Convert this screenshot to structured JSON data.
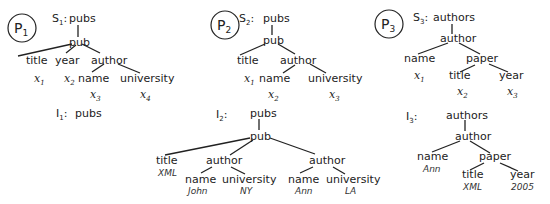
{
  "patterns": [
    {
      "id": "P",
      "sub": "1"
    },
    {
      "id": "P",
      "sub": "2"
    },
    {
      "id": "P",
      "sub": "3"
    }
  ],
  "schemas": [
    {
      "label": "S",
      "sub": "1",
      "nodes": [
        {
          "name": "pubs"
        },
        {
          "name": "pub"
        },
        {
          "name": "title",
          "var": "x",
          "vsub": "1"
        },
        {
          "name": "year",
          "var": "x",
          "vsub": "2"
        },
        {
          "name": "author"
        },
        {
          "name": "name",
          "var": "x",
          "vsub": "3"
        },
        {
          "name": "university",
          "var": "x",
          "vsub": "4"
        }
      ]
    },
    {
      "label": "S",
      "sub": "2",
      "nodes": [
        {
          "name": "pubs"
        },
        {
          "name": "pub"
        },
        {
          "name": "title",
          "var": "x",
          "vsub": "1"
        },
        {
          "name": "author"
        },
        {
          "name": "name",
          "var": "x",
          "vsub": "2"
        },
        {
          "name": "university",
          "var": "x",
          "vsub": "3"
        }
      ]
    },
    {
      "label": "S",
      "sub": "3",
      "nodes": [
        {
          "name": "authors"
        },
        {
          "name": "author"
        },
        {
          "name": "name",
          "var": "x",
          "vsub": "1"
        },
        {
          "name": "paper"
        },
        {
          "name": "title",
          "var": "x",
          "vsub": "2"
        },
        {
          "name": "year",
          "var": "x",
          "vsub": "3"
        }
      ]
    }
  ],
  "instances": [
    {
      "label": "I",
      "sub": "1",
      "nodes": [
        {
          "name": "pubs"
        }
      ]
    },
    {
      "label": "I",
      "sub": "2",
      "nodes": [
        {
          "name": "pubs"
        },
        {
          "name": "pub"
        },
        {
          "name": "title",
          "value": "XML"
        },
        {
          "name": "author"
        },
        {
          "name": "name",
          "value": "John"
        },
        {
          "name": "university",
          "value": "NY"
        },
        {
          "name": "author"
        },
        {
          "name": "name",
          "value": "Ann"
        },
        {
          "name": "university",
          "value": "LA"
        }
      ]
    },
    {
      "label": "I",
      "sub": "3",
      "nodes": [
        {
          "name": "authors"
        },
        {
          "name": "author"
        },
        {
          "name": "name",
          "value": "Ann"
        },
        {
          "name": "paper"
        },
        {
          "name": "title",
          "value": "XML"
        },
        {
          "name": "year",
          "value": "2005"
        }
      ]
    }
  ]
}
